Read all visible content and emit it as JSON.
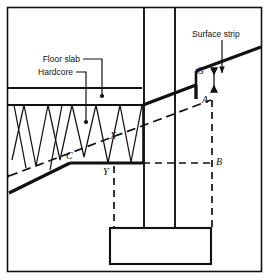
{
  "figure": {
    "width": 270,
    "height": 280,
    "background_color": "#ffffff",
    "line_color": "#111111",
    "border": {
      "present": true,
      "style": "thin-rectangle-frame"
    }
  },
  "annotations": {
    "floor_slab": {
      "label": "Floor slab",
      "leader": "line-with-dot-terminator",
      "points_to": "floor-slab-band"
    },
    "hardcore": {
      "label": "Hardcore",
      "leader": "line-with-dot-terminator",
      "points_to": "hardcore-fill-zone"
    },
    "surface_strip": {
      "label": "Surface strip",
      "leader": "line-with-arrow-terminator",
      "points_to": "surface-strip-thickness-arrow",
      "dimension_marker": "double-headed-vertical-arrow"
    }
  },
  "points": [
    {
      "id": "G",
      "label": "G",
      "x": 196,
      "y": 70,
      "note": "top of step on stripped surface line"
    },
    {
      "id": "A",
      "label": "A",
      "x": 212,
      "y": 99,
      "note": "upper level on excavation line"
    },
    {
      "id": "B",
      "label": "B",
      "x": 214,
      "y": 160,
      "note": "lower level at foundation datum"
    },
    {
      "id": "C",
      "label": "C",
      "x": 70,
      "y": 155,
      "note": "intersection on lower slope"
    },
    {
      "id": "X",
      "label": "X",
      "x": 113,
      "y": 135,
      "note": "upper intersection near column"
    },
    {
      "id": "Y",
      "label": "Y",
      "x": 106,
      "y": 166,
      "note": "lower intersection near column"
    }
  ],
  "elements": {
    "column": {
      "name": "column",
      "style": "two-vertical-solid-lines"
    },
    "footing": {
      "name": "footing",
      "style": "solid-rectangle"
    },
    "hardcore_fill": {
      "name": "hardcore-fill",
      "style": "zigzag-triangular-hatch"
    },
    "ground_line": {
      "name": "ground-line",
      "style": "thick-sloping-solid"
    },
    "strip_line": {
      "name": "stripped-surface-line",
      "style": "thick-sloping-solid-with-step"
    },
    "excavation_line": {
      "name": "excavation-line",
      "style": "sloping-dashed"
    },
    "datum_line": {
      "name": "datum-line",
      "style": "horizontal-dashed"
    },
    "projection_lines": {
      "name": "projection-lines",
      "style": "vertical-dashed"
    }
  }
}
